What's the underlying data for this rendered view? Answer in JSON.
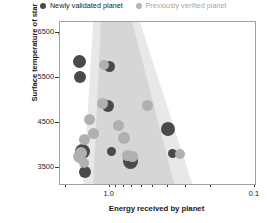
{
  "legend": {
    "items": [
      {
        "label": "Newly validated planet",
        "color": "#4a4a4a",
        "icon": "filled-circle-icon",
        "muted": false
      },
      {
        "label": "Previously verified planet",
        "color": "#b4b4b4",
        "icon": "filled-circle-icon",
        "muted": true
      }
    ]
  },
  "axes": {
    "y_title": "Surface temperature of star",
    "x_title": "Energy received by planet",
    "y_ticks": [
      "6500",
      "5500",
      "4500",
      "3500"
    ],
    "x_ticks": [
      "1.0",
      "0.1"
    ]
  },
  "annotations": [
    {
      "label": "Venus"
    },
    {
      "label": "Earth"
    },
    {
      "label": "Mars"
    }
  ],
  "colors": {
    "new_planet": "#4a4a4a",
    "old_planet": "#b0b0b0",
    "band_outer": "#e8e8e8",
    "band_inner": "#d6d6d6",
    "frame": "#a0a0a0",
    "text": "#1a1a1a"
  },
  "chart_data": {
    "type": "scatter",
    "title": "",
    "xlabel": "Energy received by planet",
    "ylabel": "Surface temperature of star",
    "xscale": "log",
    "x_reversed": true,
    "xlim": [
      2.2,
      0.1
    ],
    "ylim": [
      3150,
      6750
    ],
    "x_tick_values": [
      2.0,
      1.0,
      0.9,
      0.8,
      0.7,
      0.6,
      0.5,
      0.4,
      0.3,
      0.2,
      0.1
    ],
    "x_tick_labels": [
      "",
      "1.0",
      "",
      "",
      "",
      "",
      "",
      "",
      "",
      "",
      "0.1"
    ],
    "y_tick_values": [
      6500,
      5500,
      4500,
      3500
    ],
    "grid": false,
    "legend_position": "top-center",
    "bands": [
      {
        "name": "optimistic habitable zone",
        "color": "#e8e8e8",
        "top": {
          "temp": 6750,
          "x_inner": 1.3,
          "x_outer": 0.62
        },
        "bottom": {
          "temp": 3150,
          "x_inner": 1.52,
          "x_outer": 0.27
        }
      },
      {
        "name": "conservative habitable zone",
        "color": "#d6d6d6",
        "top": {
          "temp": 6750,
          "x_inner": 1.15,
          "x_outer": 0.7
        },
        "bottom": {
          "temp": 3150,
          "x_inner": 1.3,
          "x_outer": 0.36
        }
      }
    ],
    "reference_planets": [
      {
        "name": "Venus",
        "x": 1.91,
        "y": 5778
      },
      {
        "name": "Earth",
        "x": 1.0,
        "y": 5778
      },
      {
        "name": "Mars",
        "x": 0.43,
        "y": 5778
      }
    ],
    "series": [
      {
        "name": "Newly validated planet",
        "color": "#4a4a4a",
        "points": [
          {
            "x": 1.62,
            "y": 5880,
            "r": 6.5
          },
          {
            "x": 1.6,
            "y": 5530,
            "r": 6.0
          },
          {
            "x": 1.0,
            "y": 5770,
            "r": 5.5
          },
          {
            "x": 1.02,
            "y": 4880,
            "r": 6.0
          },
          {
            "x": 1.55,
            "y": 3870,
            "r": 7.5
          },
          {
            "x": 1.48,
            "y": 3410,
            "r": 6.0
          },
          {
            "x": 0.97,
            "y": 3880,
            "r": 4.5
          },
          {
            "x": 0.72,
            "y": 3650,
            "r": 7.5
          },
          {
            "x": 0.4,
            "y": 4380,
            "r": 7.0
          },
          {
            "x": 0.37,
            "y": 3830,
            "r": 4.5
          }
        ]
      },
      {
        "name": "Previously verified planet",
        "color": "#b0b0b0",
        "points": [
          {
            "x": 1.1,
            "y": 5790,
            "r": 5.0
          },
          {
            "x": 1.12,
            "y": 4930,
            "r": 5.5
          },
          {
            "x": 1.38,
            "y": 4580,
            "r": 5.5
          },
          {
            "x": 1.3,
            "y": 4270,
            "r": 5.5
          },
          {
            "x": 1.5,
            "y": 4130,
            "r": 5.5
          },
          {
            "x": 1.58,
            "y": 3840,
            "r": 6.0
          },
          {
            "x": 1.62,
            "y": 3760,
            "r": 6.5
          },
          {
            "x": 0.87,
            "y": 4460,
            "r": 5.5
          },
          {
            "x": 0.8,
            "y": 4180,
            "r": 6.0
          },
          {
            "x": 1.5,
            "y": 3610,
            "r": 5.0
          },
          {
            "x": 0.75,
            "y": 3790,
            "r": 5.5
          },
          {
            "x": 0.55,
            "y": 4900,
            "r": 5.5
          },
          {
            "x": 0.7,
            "y": 3770,
            "r": 5.5
          },
          {
            "x": 0.33,
            "y": 3820,
            "r": 5.0
          }
        ]
      }
    ]
  }
}
